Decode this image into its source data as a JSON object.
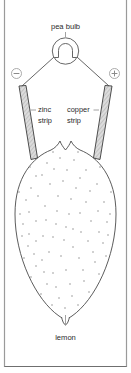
{
  "figure": {
    "frame_color": "#9a9a9a",
    "line_color": "#4a4a4a",
    "text_color": "#2b2b2b",
    "strip_fill": "#d9d9d9",
    "stipple_color": "#8d8d8d"
  },
  "labels": {
    "bulb": "pea bulb",
    "zinc_line1": "zinc",
    "zinc_line2": "strip",
    "copper_line1": "copper",
    "copper_line2": "strip",
    "lemon": "lemon"
  },
  "terminals": {
    "negative": "−",
    "positive": "+"
  },
  "components": [
    {
      "name": "pea-bulb",
      "label": "pea bulb"
    },
    {
      "name": "negative-terminal",
      "label": "−"
    },
    {
      "name": "positive-terminal",
      "label": "+"
    },
    {
      "name": "zinc-strip",
      "label": "zinc strip"
    },
    {
      "name": "copper-strip",
      "label": "copper strip"
    },
    {
      "name": "lemon",
      "label": "lemon"
    }
  ]
}
